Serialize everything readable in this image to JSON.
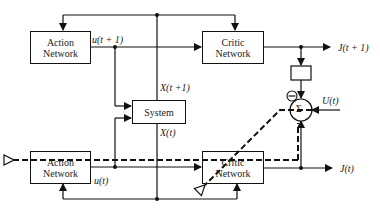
{
  "diagram": {
    "blocks": {
      "action_top": {
        "line1": "Action",
        "line2": "Network"
      },
      "critic_top": {
        "line1": "Critic",
        "line2": "Network"
      },
      "system": {
        "label": "System"
      },
      "action_bottom": {
        "line1": "Action",
        "line2": "Network"
      },
      "critic_bottom": {
        "line1": "Critic",
        "line2": "Network"
      },
      "sum_node": {
        "label": "Σ"
      },
      "minus_sign": "−"
    },
    "signals": {
      "u_next": "u(t + 1)",
      "x_next": "X(t +1)",
      "x_now": "X(t)",
      "u_now": "u(t)",
      "j_next": "J(t + 1)",
      "j_now": "J(t)",
      "utility": "U(t)"
    }
  }
}
